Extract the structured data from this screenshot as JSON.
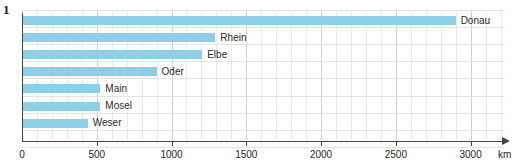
{
  "figure": {
    "number": "1"
  },
  "chart_data": {
    "type": "bar",
    "orientation": "horizontal",
    "title": "",
    "xlabel": "km",
    "ylabel": "",
    "xlim": [
      0,
      3230
    ],
    "xticks": [
      0,
      500,
      1000,
      1500,
      2000,
      2500,
      3000
    ],
    "xtick_labels": [
      "0",
      "500",
      "1000",
      "1500",
      "2000",
      "2500",
      "3000"
    ],
    "grid": true,
    "grid_minor_step": 100,
    "grid_major_step": 500,
    "legend": "none",
    "bar_color": "#8ecfe8",
    "categories": [
      "Donau",
      "Rhein",
      "Elbe",
      "Oder",
      "Main",
      "Mosel",
      "Weser"
    ],
    "values": [
      2900,
      1293,
      1205,
      900,
      524,
      524,
      440
    ],
    "bars": [
      {
        "label": "Donau",
        "value": 2900
      },
      {
        "label": "Rhein",
        "value": 1293
      },
      {
        "label": "Elbe",
        "value": 1205
      },
      {
        "label": "Oder",
        "value": 900
      },
      {
        "label": "Main",
        "value": 524
      },
      {
        "label": "Mosel",
        "value": 524
      },
      {
        "label": "Weser",
        "value": 440
      }
    ]
  }
}
